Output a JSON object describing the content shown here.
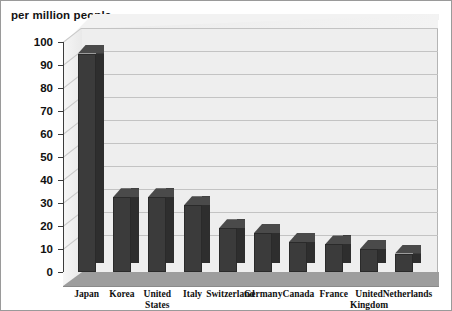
{
  "chart": {
    "type": "bar",
    "axis_title": "per million people"
  },
  "chart_data": {
    "type": "bar",
    "title": "",
    "ylabel": "per million people",
    "xlabel": "",
    "ylim": [
      0,
      100
    ],
    "ytick_step": 10,
    "grid": true,
    "legend": "none",
    "style": "3d-column",
    "bar_color": "#3b3b3b",
    "plot_background": "#eeeeee",
    "floor_color": "#9d9d9d",
    "categories": [
      "Japan",
      "Korea",
      "United States",
      "Italy",
      "Switzerland",
      "Germany",
      "Canada",
      "France",
      "United Kingdom",
      "Netherlands"
    ],
    "values": [
      95,
      32.5,
      32.5,
      29,
      19,
      17,
      13,
      12,
      10,
      8
    ],
    "yticks": [
      "0",
      "10",
      "20",
      "30",
      "40",
      "50",
      "60",
      "70",
      "80",
      "90",
      "100"
    ]
  }
}
